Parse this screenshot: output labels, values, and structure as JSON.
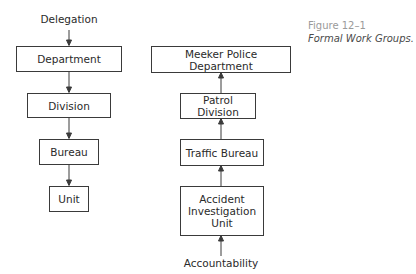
{
  "caption": {
    "figure_number": "Figure 12–1",
    "title": "Formal Work Groups."
  },
  "left_chain": {
    "top_label": "Delegation",
    "direction": "downward",
    "boxes": [
      "Department",
      "Division",
      "Bureau",
      "Unit"
    ]
  },
  "right_chain": {
    "bottom_label": "Accountability",
    "direction": "upward",
    "boxes": [
      "Meeker Police Department",
      "Patrol Division",
      "Traffic Bureau",
      "Accident Investigation Unit"
    ]
  },
  "colors": {
    "line": "#3a3a3a",
    "text": "#2a2a2a",
    "caption_number": "#9a9a9a",
    "caption_title": "#4a4a4a"
  }
}
